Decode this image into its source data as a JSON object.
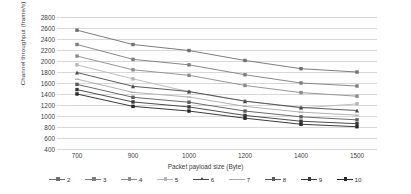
{
  "chart_data": {
    "type": "line",
    "title": "",
    "xlabel": "Packet payload size (Byte)",
    "ylabel": "Channel throughput (frame/s)",
    "categories": [
      "700",
      "900",
      "1000",
      "1200",
      "1400",
      "1500"
    ],
    "x_values": [
      700,
      900,
      1000,
      1200,
      1400,
      1500
    ],
    "ylim": [
      400,
      2800
    ],
    "y_ticks": [
      "2800",
      "2600",
      "2400",
      "2200",
      "2000",
      "1800",
      "1600",
      "1400",
      "1200",
      "1000",
      "800",
      "600",
      "400"
    ],
    "y_tick_values": [
      2800,
      2600,
      2400,
      2200,
      2000,
      1800,
      1600,
      1400,
      1200,
      1000,
      800,
      600,
      400
    ],
    "grid": true,
    "legend_position": "bottom",
    "legend_title": "",
    "series": [
      {
        "name": "2",
        "values": [
          2560,
          2300,
          2190,
          2010,
          1860,
          1800
        ],
        "color": "#6f6f6f",
        "marker": "square"
      },
      {
        "name": "3",
        "values": [
          2300,
          2030,
          1930,
          1750,
          1600,
          1545
        ],
        "color": "#7d7d7d",
        "marker": "square"
      },
      {
        "name": "4",
        "values": [
          2090,
          1840,
          1740,
          1555,
          1425,
          1360
        ],
        "color": "#8c8c8c",
        "marker": "square"
      },
      {
        "name": "5",
        "values": [
          1930,
          1675,
          1440,
          1270,
          1145,
          1220
        ],
        "color": "#b5b5b5",
        "marker": "square"
      },
      {
        "name": "6",
        "values": [
          1790,
          1540,
          1445,
          1270,
          1155,
          1100
        ],
        "color": "#4a4a4a",
        "marker": "triangle"
      },
      {
        "name": "7",
        "values": [
          1670,
          1430,
          1345,
          1175,
          1070,
          1015
        ],
        "color": "#a9a9a9",
        "marker": "dash"
      },
      {
        "name": "8",
        "values": [
          1575,
          1340,
          1250,
          1090,
          985,
          930
        ],
        "color": "#5a5a5a",
        "marker": "square"
      },
      {
        "name": "9",
        "values": [
          1480,
          1255,
          1165,
          1010,
          905,
          860
        ],
        "color": "#3a3a3a",
        "marker": "square"
      },
      {
        "name": "10",
        "values": [
          1400,
          1175,
          1090,
          960,
          850,
          805
        ],
        "color": "#262626",
        "marker": "square"
      }
    ]
  }
}
